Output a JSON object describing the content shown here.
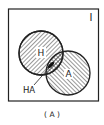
{
  "diagram": {
    "universe_label": "I",
    "set_h_label": "H",
    "set_a_label": "A",
    "intersection_label": "HA",
    "caption": "( A )"
  },
  "colors": {
    "ink": "#222222",
    "background": "#ffffff"
  }
}
